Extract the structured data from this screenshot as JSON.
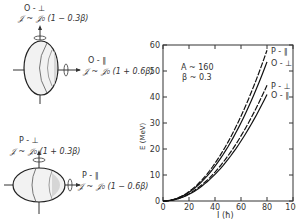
{
  "figure": {
    "oblate": {
      "perp_label": "O - ⊥",
      "perp_formula": "𝒥 ~ 𝒥₀ (1 − 0.3β)",
      "par_label": "O - ∥",
      "par_formula": "𝒥 ~ 𝒥₀ (1 + 0.6β)"
    },
    "prolate": {
      "perp_label": "P - ⊥",
      "perp_formula": "𝒥 ~ 𝒥₀ (1 + 0.3β)",
      "par_label": "P - ∥",
      "par_formula": "𝒥 ~ 𝒥₀ (1 − 0.6β)"
    }
  },
  "chart_data": {
    "type": "line",
    "title": "",
    "xlabel": "I (ħ)",
    "ylabel": "E (MeV)",
    "xlim": [
      0,
      100
    ],
    "ylim": [
      0,
      60
    ],
    "xticks": [
      0,
      20,
      40,
      60,
      80,
      100
    ],
    "yticks": [
      0,
      10,
      20,
      30,
      40,
      50,
      60
    ],
    "annotation": [
      "A ~ 160",
      "β ~ 0.3"
    ],
    "grid": false,
    "x": [
      0,
      10,
      20,
      30,
      40,
      50,
      60,
      70,
      80
    ],
    "series": [
      {
        "name": "P - ∥",
        "style": "dashed",
        "values": [
          0,
          0.9,
          3.6,
          8.2,
          14.5,
          22.7,
          32.6,
          44.4,
          58
        ]
      },
      {
        "name": "O - ⊥",
        "style": "solid",
        "values": [
          0,
          0.8,
          3.3,
          7.5,
          13.4,
          20.9,
          30.1,
          41.0,
          53.5
        ]
      },
      {
        "name": "P - ⊥",
        "style": "dashed",
        "values": [
          0,
          0.7,
          2.8,
          6.3,
          11.1,
          17.4,
          25.0,
          34.1,
          44.5
        ]
      },
      {
        "name": "O - ∥",
        "style": "solid",
        "values": [
          0,
          0.6,
          2.6,
          5.8,
          10.3,
          16.0,
          23.1,
          31.4,
          41.0
        ]
      }
    ]
  }
}
